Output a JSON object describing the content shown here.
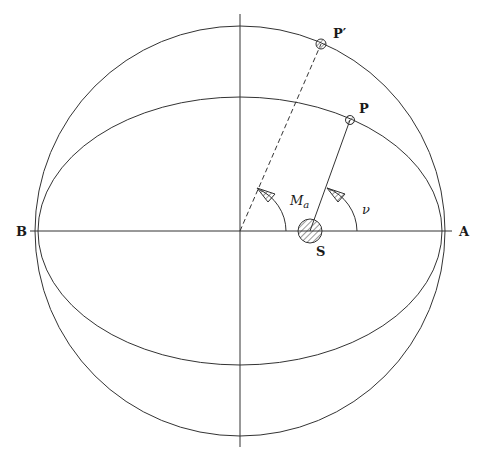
{
  "diagram": {
    "colors": {
      "stroke": "#333333",
      "background": "#ffffff",
      "label": "#1a1a1a"
    },
    "auxiliary_circle": {
      "cx": 240,
      "cy": 231,
      "r": 205
    },
    "orbit_ellipse": {
      "cx": 240,
      "cy": 231,
      "rx": 205,
      "ry": 134
    },
    "points": {
      "A": {
        "label": "A",
        "x": 445,
        "y": 231
      },
      "B": {
        "label": "B",
        "x": 35,
        "y": 231
      },
      "S": {
        "label": "S",
        "x": 310,
        "y": 231,
        "r": 12
      },
      "P": {
        "label": "P",
        "x": 350,
        "y": 120
      },
      "P_prime": {
        "label": "P′",
        "x": 321,
        "y": 44
      }
    },
    "angles": {
      "mean_anomaly": {
        "symbol": "M",
        "subscript": "a"
      },
      "true_anomaly": {
        "symbol": "ν"
      }
    }
  }
}
